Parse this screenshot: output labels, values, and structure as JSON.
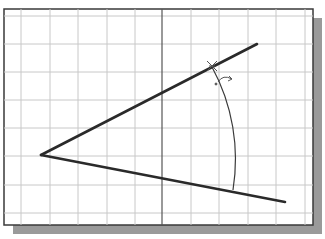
{
  "drawing": {
    "title": "Angle dimension construction",
    "colors": {
      "background": "#ffffff",
      "frame": "#3a3a3a",
      "shadow": "#9a9a9a",
      "grid": "#c8c8c8",
      "axis": "#555555",
      "line": "#2a2a2a",
      "arc": "#3a3a3a"
    },
    "frame": {
      "x": 4,
      "y": 9,
      "width": 309,
      "height": 216,
      "shadow_offset": 9
    },
    "grid": {
      "vertical_x": [
        21,
        50,
        78,
        107,
        135,
        191,
        219,
        248,
        276,
        305
      ],
      "horizontal_y": [
        16,
        44,
        72,
        100,
        128,
        156,
        185,
        213
      ],
      "axis_x": 162
    },
    "vertex": {
      "x": 41,
      "y": 155
    },
    "upper_line_end": {
      "x": 257,
      "y": 44
    },
    "lower_line_end": {
      "x": 285,
      "y": 202
    },
    "arc": {
      "start": {
        "x": 212,
        "y": 67
      },
      "end": {
        "x": 233,
        "y": 190
      },
      "radius": 193
    },
    "cursor": {
      "x": 212,
      "y": 66,
      "icon": "crosshair-icon"
    },
    "rotate_glyph": {
      "x": 226,
      "y": 80,
      "icon": "angle-rotate-icon"
    }
  }
}
